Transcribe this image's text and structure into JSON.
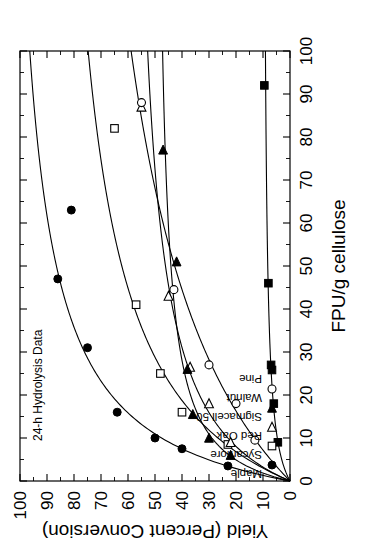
{
  "chart_data": {
    "type": "scatter",
    "title": "",
    "annotation": "24-h Hydrolysis Data",
    "xlabel": "FPU/g cellulose",
    "ylabel": "Yield (Percent Conversion)",
    "xlim": [
      0,
      100
    ],
    "ylim": [
      0,
      100
    ],
    "xticks": [
      0,
      10,
      20,
      30,
      40,
      50,
      60,
      70,
      80,
      90,
      100
    ],
    "yticks": [
      0,
      10,
      20,
      30,
      40,
      50,
      60,
      70,
      80,
      90,
      100
    ],
    "xtick_labels": [
      "0",
      "10",
      "20",
      "30",
      "40",
      "50",
      "60",
      "70",
      "80",
      "90",
      "100"
    ],
    "ytick_labels": [
      "0",
      "10",
      "20",
      "30",
      "40",
      "50",
      "60",
      "70",
      "80",
      "90",
      "100"
    ],
    "grid": false,
    "minor_ticks": true,
    "legend_position": "top-left",
    "rotation_deg": -90,
    "series": [
      {
        "name": "Maple",
        "marker": "filled-circle",
        "x": [
          3.5,
          7.5,
          10,
          16,
          31,
          47,
          63
        ],
        "y": [
          23,
          40,
          50,
          64,
          75,
          86,
          81
        ]
      },
      {
        "name": "Sycamore",
        "marker": "open-square",
        "x": [
          8.5,
          16,
          25,
          41,
          82
        ],
        "y": [
          23,
          40,
          48,
          57,
          65
        ]
      },
      {
        "name": "Red Oak",
        "marker": "open-triangle-right",
        "x": [
          9,
          18,
          26.5,
          43,
          87
        ],
        "y": [
          22,
          30,
          37,
          45,
          55
        ]
      },
      {
        "name": "Sigmacell 50",
        "marker": "filled-triangle-right",
        "x": [
          6,
          10,
          15.5,
          26,
          51,
          77
        ],
        "y": [
          22,
          30,
          36,
          38,
          42,
          47
        ]
      },
      {
        "name": "Walnut",
        "marker": "open-circle",
        "x": [
          9.5,
          18,
          27,
          44.5,
          88
        ],
        "y": [
          13,
          20,
          30,
          43,
          55
        ]
      },
      {
        "name": "Pine",
        "marker": "filled-square",
        "x": [
          9,
          18,
          27,
          46,
          92
        ],
        "y": [
          4.5,
          6,
          7,
          8,
          9.5
        ]
      }
    ]
  },
  "axes": {
    "x_title": "FPU/g cellulose",
    "y_title": "Yield (Percent Conversion)"
  },
  "annotation": {
    "text": "24-h Hydrolysis Data"
  },
  "legend": {
    "items": [
      {
        "label": "Maple",
        "marker": "filled-circle"
      },
      {
        "label": "Sycamore",
        "marker": "open-square"
      },
      {
        "label": "Red Oak",
        "marker": "open-triangle-right"
      },
      {
        "label": "Sigmacell 50",
        "marker": "filled-triangle-right"
      },
      {
        "label": "Walnut",
        "marker": "open-circle"
      },
      {
        "label": "Pine",
        "marker": "filled-square"
      }
    ]
  },
  "colors": {
    "ink": "#000000",
    "paper": "#ffffff"
  }
}
